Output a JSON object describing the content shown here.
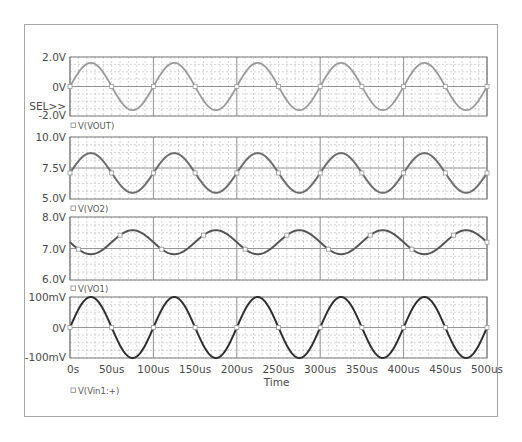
{
  "chart_data": [
    {
      "type": "line",
      "panel": 1,
      "title": "",
      "xlabel": "",
      "ylabel": "",
      "ylim": [
        -2.0,
        2.0
      ],
      "y_ticks": [
        "2.0V",
        "0V",
        "-2.0V"
      ],
      "y_tick_values": [
        2.0,
        0.0,
        -2.0
      ],
      "selector_label": "SEL>>",
      "legend": [
        "V(VOUT)"
      ],
      "series": [
        {
          "name": "V(VOUT)",
          "color": "#9a9a9a",
          "offset": 0.0,
          "amplitude": 1.6,
          "period_us": 100,
          "phase_deg": 0
        }
      ],
      "grid": true
    },
    {
      "type": "line",
      "panel": 2,
      "ylim": [
        5.0,
        10.0
      ],
      "y_ticks": [
        "10.0V",
        "7.5V",
        "5.0V"
      ],
      "y_tick_values": [
        10.0,
        7.5,
        5.0
      ],
      "legend": [
        "V(VO2)"
      ],
      "series": [
        {
          "name": "V(VO2)",
          "color": "#6e6e6e",
          "offset": 7.1,
          "amplitude": 1.6,
          "period_us": 100,
          "phase_deg": 0
        }
      ],
      "grid": true
    },
    {
      "type": "line",
      "panel": 3,
      "ylim": [
        6.0,
        8.0
      ],
      "y_ticks": [
        "8.0V",
        "7.0V",
        "6.0V"
      ],
      "y_tick_values": [
        8.0,
        7.0,
        6.0
      ],
      "legend": [
        "V(VO1)"
      ],
      "series": [
        {
          "name": "V(VO1)",
          "color": "#555555",
          "offset": 7.2,
          "amplitude": 0.38,
          "period_us": 100,
          "phase_deg": 180
        }
      ],
      "grid": true
    },
    {
      "type": "line",
      "panel": 4,
      "ylim": [
        -0.1,
        0.1
      ],
      "y_ticks": [
        "100mV",
        "0V",
        "-100mV"
      ],
      "y_tick_values": [
        0.1,
        0.0,
        -0.1
      ],
      "legend": [
        "V(Vin1:+)"
      ],
      "series": [
        {
          "name": "V(Vin1:+)",
          "color": "#2f2f2f",
          "offset": 0.0,
          "amplitude": 0.1,
          "period_us": 100,
          "phase_deg": 0
        }
      ],
      "grid": true
    }
  ],
  "x_axis": {
    "label": "Time",
    "range_us": [
      0,
      500
    ],
    "ticks": [
      "0s",
      "50us",
      "100us",
      "150us",
      "200us",
      "250us",
      "300us",
      "350us",
      "400us",
      "450us",
      "500us"
    ],
    "tick_values_us": [
      0,
      50,
      100,
      150,
      200,
      250,
      300,
      350,
      400,
      450,
      500
    ]
  }
}
